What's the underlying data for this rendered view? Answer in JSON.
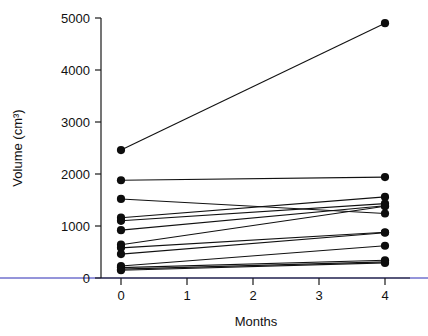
{
  "chart_data": {
    "type": "line",
    "title": "",
    "subtitle": "",
    "xlabel": "Months",
    "ylabel": "Volume (cm³)",
    "x": [
      0,
      4
    ],
    "xlim": [
      0,
      4
    ],
    "ylim": [
      0,
      5000
    ],
    "xticks": [
      0,
      1,
      2,
      3,
      4
    ],
    "xtick_labels": [
      "0",
      "1",
      "2",
      "3",
      "4"
    ],
    "yticks": [
      0,
      1000,
      2000,
      3000,
      4000,
      5000
    ],
    "ytick_labels": [
      "0",
      "1000",
      "2000",
      "3000",
      "4000",
      "5000"
    ],
    "grid": false,
    "legend": "none",
    "marker": "filled-circle",
    "series": [
      {
        "name": "subject-1",
        "values": [
          2460,
          4900
        ]
      },
      {
        "name": "subject-2",
        "values": [
          1880,
          1940
        ]
      },
      {
        "name": "subject-3",
        "values": [
          1520,
          1240
        ]
      },
      {
        "name": "subject-4",
        "values": [
          1160,
          1560
        ]
      },
      {
        "name": "subject-5",
        "values": [
          1100,
          1430
        ]
      },
      {
        "name": "subject-6",
        "values": [
          920,
          1390
        ]
      },
      {
        "name": "subject-7",
        "values": [
          640,
          1380
        ]
      },
      {
        "name": "subject-8",
        "values": [
          580,
          880
        ]
      },
      {
        "name": "subject-9",
        "values": [
          460,
          870
        ]
      },
      {
        "name": "subject-10",
        "values": [
          230,
          620
        ]
      },
      {
        "name": "subject-11",
        "values": [
          200,
          340
        ]
      },
      {
        "name": "subject-12",
        "values": [
          170,
          310
        ]
      },
      {
        "name": "subject-13",
        "values": [
          150,
          290
        ]
      }
    ]
  },
  "axes": {
    "x_title": "Months",
    "y_title": "Volume (cm³)",
    "y_labels": {
      "t0": "0",
      "t1": "1000",
      "t2": "2000",
      "t3": "3000",
      "t4": "4000",
      "t5": "5000"
    },
    "x_labels": {
      "t0": "0",
      "t1": "1",
      "t2": "2",
      "t3": "3",
      "t4": "4"
    }
  },
  "colors": {
    "line": "#111111",
    "point": "#0d0d0d",
    "axis": "#1a1a1a",
    "background": "#ffffff",
    "accent_blue": "#2b2bb5"
  }
}
